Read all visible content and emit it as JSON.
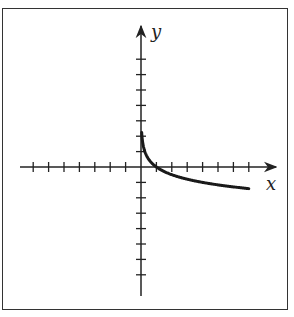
{
  "chart_data": {
    "type": "line",
    "title": "",
    "xlabel": "x",
    "ylabel": "y",
    "xlim": [
      -7,
      7
    ],
    "ylim": [
      -7,
      7
    ],
    "x_ticks": [
      -7,
      -6,
      -5,
      -4,
      -3,
      -2,
      -1,
      1,
      2,
      3,
      4,
      5,
      6,
      7
    ],
    "y_ticks": [
      -7,
      -6,
      -5,
      -4,
      -3,
      -2,
      -1,
      1,
      2,
      3,
      4,
      5,
      6,
      7
    ],
    "tick_labels_shown": false,
    "grid": false,
    "series": [
      {
        "name": "curve",
        "description": "decreasing logarithmic curve, y = log base 1/4 of x",
        "x": [
          0.05,
          0.1,
          0.25,
          0.5,
          1,
          2,
          3,
          4,
          5,
          6,
          7
        ],
        "y": [
          2.16,
          1.66,
          1.0,
          0.5,
          0.0,
          -0.5,
          -0.79,
          -1.0,
          -1.16,
          -1.29,
          -1.4
        ]
      }
    ],
    "colors": {
      "axis": "#222222",
      "curve": "#1a1a1a",
      "frame": "#333333"
    }
  },
  "labels": {
    "x_axis": "x",
    "y_axis": "y"
  }
}
